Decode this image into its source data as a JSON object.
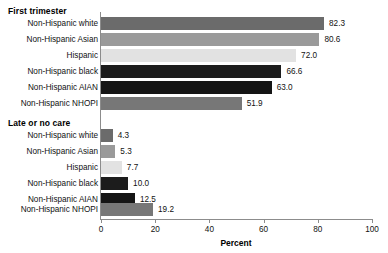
{
  "chart_data": {
    "type": "bar",
    "orientation": "horizontal",
    "title": "",
    "xlabel": "Percent",
    "ylabel": "",
    "xlim": [
      0,
      100
    ],
    "xticks": [
      0,
      20,
      40,
      60,
      80,
      100
    ],
    "xtick_labels": [
      "0",
      "20",
      "40",
      "60",
      "80",
      "100"
    ],
    "grid": false,
    "legend": "none",
    "categories": [
      "Non-Hispanic white",
      "Non-Hispanic Asian",
      "Hispanic",
      "Non-Hispanic black",
      "Non-Hispanic AIAN",
      "Non-Hispanic NHOPI"
    ],
    "category_colors": [
      "#6b6b6b",
      "#9a9a9a",
      "#e2e2e2",
      "#1c1c1c",
      "#151515",
      "#777777"
    ],
    "groups": [
      {
        "heading": "First trimester",
        "bars": [
          {
            "label": "Non-Hispanic white",
            "value": 82.3,
            "value_label": "82.3",
            "color": "#6b6b6b"
          },
          {
            "label": "Non-Hispanic Asian",
            "value": 80.6,
            "value_label": "80.6",
            "color": "#9a9a9a"
          },
          {
            "label": "Hispanic",
            "value": 72.0,
            "value_label": "72.0",
            "color": "#e2e2e2"
          },
          {
            "label": "Non-Hispanic black",
            "value": 66.6,
            "value_label": "66.6",
            "color": "#1c1c1c"
          },
          {
            "label": "Non-Hispanic AIAN",
            "value": 63.0,
            "value_label": "63.0",
            "color": "#151515"
          },
          {
            "label": "Non-Hispanic NHOPI",
            "value": 51.9,
            "value_label": "51.9",
            "color": "#777777"
          }
        ]
      },
      {
        "heading": "Late or no care",
        "bars": [
          {
            "label": "Non-Hispanic white",
            "value": 4.3,
            "value_label": "4.3",
            "color": "#6b6b6b"
          },
          {
            "label": "Non-Hispanic Asian",
            "value": 5.3,
            "value_label": "5.3",
            "color": "#9a9a9a"
          },
          {
            "label": "Hispanic",
            "value": 7.7,
            "value_label": "7.7",
            "color": "#e2e2e2"
          },
          {
            "label": "Non-Hispanic black",
            "value": 10.0,
            "value_label": "10.0",
            "color": "#1c1c1c"
          },
          {
            "label": "Non-Hispanic AIAN",
            "value": 12.5,
            "value_label": "12.5",
            "color": "#151515"
          },
          {
            "label": "Non-Hispanic NHOPI",
            "value": 19.2,
            "value_label": "19.2",
            "color": "#777777"
          }
        ]
      }
    ]
  }
}
